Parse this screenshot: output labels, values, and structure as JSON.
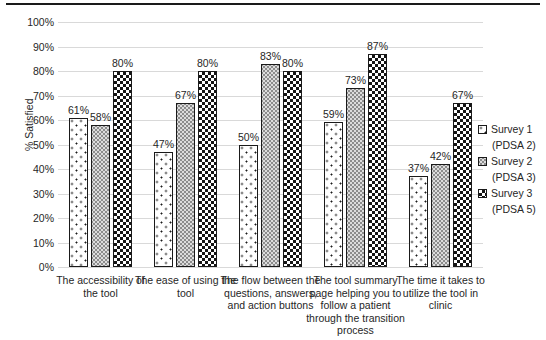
{
  "page": {
    "background": "#ffffff",
    "top_rule_color": "#1a1a1a"
  },
  "colors": {
    "grid": "#d9d9d9",
    "text": "#262626",
    "bar_border": "#1a1a1a",
    "halftone_fill": "#dcdcdc",
    "checker_fill": "#141414"
  },
  "chart_data": {
    "type": "bar",
    "title": "",
    "xlabel": "",
    "ylabel": "% Satisfied",
    "ylim": [
      0,
      100
    ],
    "ytick_step": 10,
    "ytick_labels": [
      "100%",
      "90%",
      "80%",
      "70%",
      "60%",
      "50%",
      "40%",
      "30%",
      "20%",
      "10%",
      "0%"
    ],
    "grid": "horizontal",
    "legend_position": "right",
    "value_suffix": "%",
    "categories": [
      "The accessibility of\nthe tool",
      "The ease of using the\ntool",
      "The flow between the\nquestions, answers,\nand action buttons",
      "The tool summary\npage helping you to\nfollow a patient\nthrough the transition\nprocess",
      "The time it takes to\nutilize the tool in\nclinic"
    ],
    "series": [
      {
        "name": "Survey 1",
        "sublabel": "(PDSA 2)",
        "pattern": "sparse-dots",
        "values": [
          61,
          47,
          50,
          59,
          37
        ]
      },
      {
        "name": "Survey 2",
        "sublabel": "(PDSA 3)",
        "pattern": "halftone-gray",
        "values": [
          58,
          67,
          83,
          73,
          42
        ]
      },
      {
        "name": "Survey 3",
        "sublabel": "(PDSA 5)",
        "pattern": "checkerboard",
        "values": [
          80,
          80,
          80,
          87,
          67
        ]
      }
    ],
    "value_labels": [
      [
        "61%",
        "47%",
        "50%",
        "59%",
        "37%"
      ],
      [
        "58%",
        "67%",
        "83%",
        "73%",
        "42%"
      ],
      [
        "80%",
        "80%",
        "80%",
        "87%",
        "67%"
      ]
    ]
  }
}
